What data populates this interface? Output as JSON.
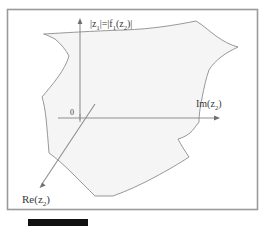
{
  "figure": {
    "kind": "math-diagram",
    "background_color": "#ffffff",
    "frame": {
      "border_color": "#9a9a9a",
      "fill_color": "#ffffff",
      "x": 7,
      "y": 9,
      "width": 251,
      "height": 201
    },
    "region": {
      "name": "complex-domain-region",
      "fill_color": "#f5f5f5",
      "stroke_color": "#8c8c8c"
    },
    "axes": [
      {
        "name": "vertical-axis",
        "label": "|z₁|=|f₁(z₂)|",
        "label_parts": {
          "lhs": "|z",
          "lhs_sub": "1",
          "lhs_tail": "|",
          "eq": "=",
          "rhs": "|f",
          "rhs_sub": "1",
          "rhs_arg": "(z",
          "rhs_arg_sub": "2",
          "rhs_tail": ")|"
        },
        "direction": "up",
        "color": "#7a7a7a"
      },
      {
        "name": "imaginary-axis",
        "label": "Im(z₂)",
        "label_parts": {
          "head": "Im(z",
          "sub": "2",
          "tail": ")"
        },
        "direction": "right",
        "color": "#7a7a7a"
      },
      {
        "name": "real-axis",
        "label": "Re(z₂)",
        "label_parts": {
          "head": "Re(z",
          "sub": "2",
          "tail": ")"
        },
        "direction": "down-left",
        "color": "#7a7a7a"
      }
    ],
    "origin": {
      "name": "origin-label",
      "label": "0",
      "color": "#3a3a3a"
    },
    "caption_bar": {
      "name": "redacted-caption-bar",
      "color": "#111111",
      "x": 28,
      "y": 219,
      "width": 60,
      "height": 7
    }
  }
}
